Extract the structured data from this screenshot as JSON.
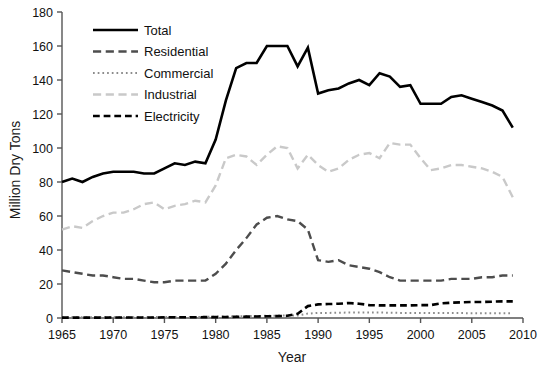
{
  "chart_data": {
    "type": "line",
    "title": "",
    "xlabel": "Year",
    "ylabel": "Million Dry Tons",
    "xlim": [
      1965,
      2010
    ],
    "ylim": [
      0,
      180
    ],
    "xticks": [
      1965,
      1970,
      1975,
      1980,
      1985,
      1990,
      1995,
      2000,
      2005,
      2010
    ],
    "yticks": [
      0,
      20,
      40,
      60,
      80,
      100,
      120,
      140,
      160,
      180
    ],
    "grid": false,
    "legend_position": "top-left-inside",
    "x": [
      1965,
      1966,
      1967,
      1968,
      1969,
      1970,
      1971,
      1972,
      1973,
      1974,
      1975,
      1976,
      1977,
      1978,
      1979,
      1980,
      1981,
      1982,
      1983,
      1984,
      1985,
      1986,
      1987,
      1988,
      1989,
      1990,
      1991,
      1992,
      1993,
      1994,
      1995,
      1996,
      1997,
      1998,
      1999,
      2000,
      2001,
      2002,
      2003,
      2004,
      2005,
      2006,
      2007,
      2008,
      2009
    ],
    "series": [
      {
        "name": "Total",
        "color": "#000000",
        "style": "solid",
        "width": 2.6,
        "values": [
          80,
          82,
          80,
          83,
          85,
          86,
          86,
          86,
          85,
          85,
          88,
          91,
          90,
          92,
          91,
          105,
          128,
          147,
          150,
          150,
          160,
          160,
          160,
          148,
          159,
          132,
          134,
          135,
          138,
          140,
          137,
          144,
          142,
          136,
          137,
          126,
          126,
          126,
          130,
          131,
          129,
          127,
          125,
          122,
          112
        ]
      },
      {
        "name": "Residential",
        "color": "#4d4d4d",
        "style": "dash-long",
        "width": 2.4,
        "values": [
          28,
          27,
          26,
          25,
          25,
          24,
          23,
          23,
          22,
          21,
          21,
          22,
          22,
          22,
          22,
          26,
          32,
          40,
          47,
          55,
          59,
          60,
          58,
          57,
          52,
          34,
          33,
          34,
          31,
          30,
          29,
          27,
          24,
          22,
          22,
          22,
          22,
          22,
          23,
          23,
          23,
          24,
          24,
          25,
          25
        ]
      },
      {
        "name": "Commercial",
        "color": "#8c8c8c",
        "style": "dot",
        "width": 2.0,
        "values": [
          0.4,
          0.4,
          0.4,
          0.4,
          0.4,
          0.5,
          0.5,
          0.5,
          0.5,
          0.5,
          0.6,
          0.6,
          0.6,
          0.6,
          0.7,
          0.8,
          0.9,
          1.0,
          1.1,
          1.2,
          1.3,
          1.4,
          1.4,
          1.5,
          2.6,
          3.0,
          3.0,
          3.1,
          3.2,
          3.2,
          3.2,
          3.2,
          3.1,
          3.0,
          3.0,
          3.0,
          2.9,
          2.9,
          2.9,
          2.9,
          2.8,
          2.8,
          2.8,
          2.8,
          2.8
        ]
      },
      {
        "name": "Industrial",
        "color": "#c9c9c9",
        "style": "dash-long",
        "width": 2.4,
        "values": [
          52,
          54,
          53,
          57,
          60,
          62,
          62,
          64,
          67,
          68,
          64,
          66,
          67,
          69,
          68,
          78,
          94,
          96,
          95,
          90,
          96,
          101,
          100,
          88,
          96,
          90,
          86,
          88,
          93,
          96,
          97,
          94,
          103,
          102,
          102,
          94,
          87,
          88,
          90,
          90,
          89,
          88,
          86,
          83,
          71
        ]
      },
      {
        "name": "Electricity",
        "color": "#000000",
        "style": "dash",
        "width": 2.6,
        "values": [
          0.2,
          0.2,
          0.2,
          0.2,
          0.2,
          0.3,
          0.3,
          0.3,
          0.3,
          0.3,
          0.4,
          0.4,
          0.4,
          0.4,
          0.5,
          0.5,
          0.6,
          0.7,
          0.8,
          0.9,
          1.0,
          1.1,
          1.3,
          2.5,
          7.0,
          8.0,
          8.2,
          8.4,
          8.8,
          8.4,
          7.6,
          7.4,
          7.4,
          7.4,
          7.4,
          7.6,
          7.6,
          8.6,
          9.0,
          9.2,
          9.4,
          9.4,
          9.6,
          9.8,
          9.8
        ]
      }
    ],
    "legend": [
      {
        "label": "Total",
        "color": "#000000",
        "style": "solid"
      },
      {
        "label": "Residential",
        "color": "#4d4d4d",
        "style": "dash-long"
      },
      {
        "label": "Commercial",
        "color": "#8c8c8c",
        "style": "dot"
      },
      {
        "label": "Industrial",
        "color": "#c9c9c9",
        "style": "dash-long"
      },
      {
        "label": "Electricity",
        "color": "#000000",
        "style": "dash"
      }
    ]
  }
}
